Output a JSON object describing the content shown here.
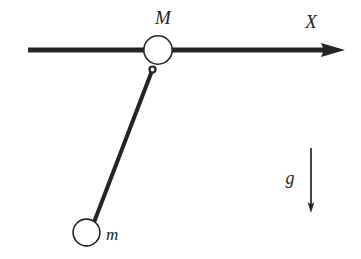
{
  "figure": {
    "kind": "physics-free-body-diagram",
    "background_color": "#ffffff",
    "stroke_color": "#242424"
  },
  "labels": {
    "cart_mass": "M",
    "bob_mass": "m",
    "axis": "X",
    "gravity": "g"
  },
  "geometry": {
    "cart": {
      "cx": 158,
      "cy": 50,
      "r": 14.5
    },
    "bob": {
      "cx": 86.5,
      "cy": 232.5,
      "r": 13.5
    },
    "pivot": {
      "cx": 152.5,
      "cy": 69.5,
      "r": 3
    },
    "axis_line": {
      "x1": 28,
      "y1": 50,
      "x2": 345,
      "y2": 50,
      "thickness": 5
    },
    "axis_arrowhead": {
      "tip_x": 345,
      "tip_y": 50,
      "base_x": 322,
      "half_height": 7.5
    },
    "rod": {
      "x1": 152.5,
      "y1": 69.5,
      "x2": 95,
      "y2": 221,
      "thickness": 4
    },
    "gravity_arrow": {
      "x": 311,
      "y1": 148,
      "y2": 212,
      "thickness": 1.6
    },
    "gravity_arrowhead": {
      "tip_x": 311,
      "tip_y": 213,
      "base_y": 203,
      "half_width": 3.2
    }
  },
  "label_positions": {
    "cart_mass": {
      "x": 163,
      "y": 24
    },
    "bob_mass": {
      "x": 106,
      "y": 240
    },
    "axis": {
      "x": 311,
      "y": 28
    },
    "gravity": {
      "x": 290,
      "y": 184
    }
  }
}
